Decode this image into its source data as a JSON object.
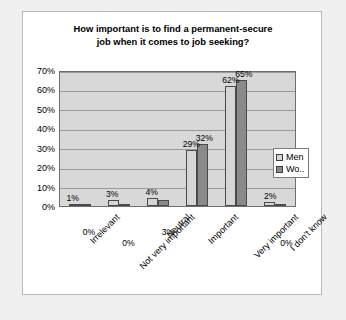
{
  "chart_data": {
    "type": "bar",
    "title": "How important is to find a permanent-secure job when it comes to job seeking?",
    "title_line1": "How important is to find a permanent-secure",
    "title_line2": "job when it comes to job seeking?",
    "xlabel": "",
    "ylabel": "",
    "ylim": [
      0,
      70
    ],
    "ytick_labels": [
      "70%",
      "60%",
      "50%",
      "40%",
      "30%",
      "20%",
      "10%",
      "0%"
    ],
    "ytick_values": [
      70,
      60,
      50,
      40,
      30,
      20,
      10,
      0
    ],
    "grid": true,
    "legend_position": "right-inside",
    "categories": [
      "Irrelevant",
      "Not very important",
      "Neutral",
      "Important",
      "Very important",
      "I don't know"
    ],
    "series": [
      {
        "name": "Men",
        "color": "#d6d6d6",
        "values": [
          1,
          3,
          4,
          29,
          62,
          2
        ],
        "labels": [
          "1%",
          "3%",
          "4%",
          "29%",
          "62%",
          "2%"
        ]
      },
      {
        "name": "Wo..",
        "color": "#8a8a8a",
        "values": [
          0,
          0,
          3,
          32,
          65,
          0
        ],
        "labels": [
          "0%",
          "0%",
          "3%",
          "32%",
          "65%",
          "0%"
        ]
      }
    ]
  },
  "legend": {
    "items": [
      {
        "label": "Men"
      },
      {
        "label": "Wo.."
      }
    ]
  }
}
